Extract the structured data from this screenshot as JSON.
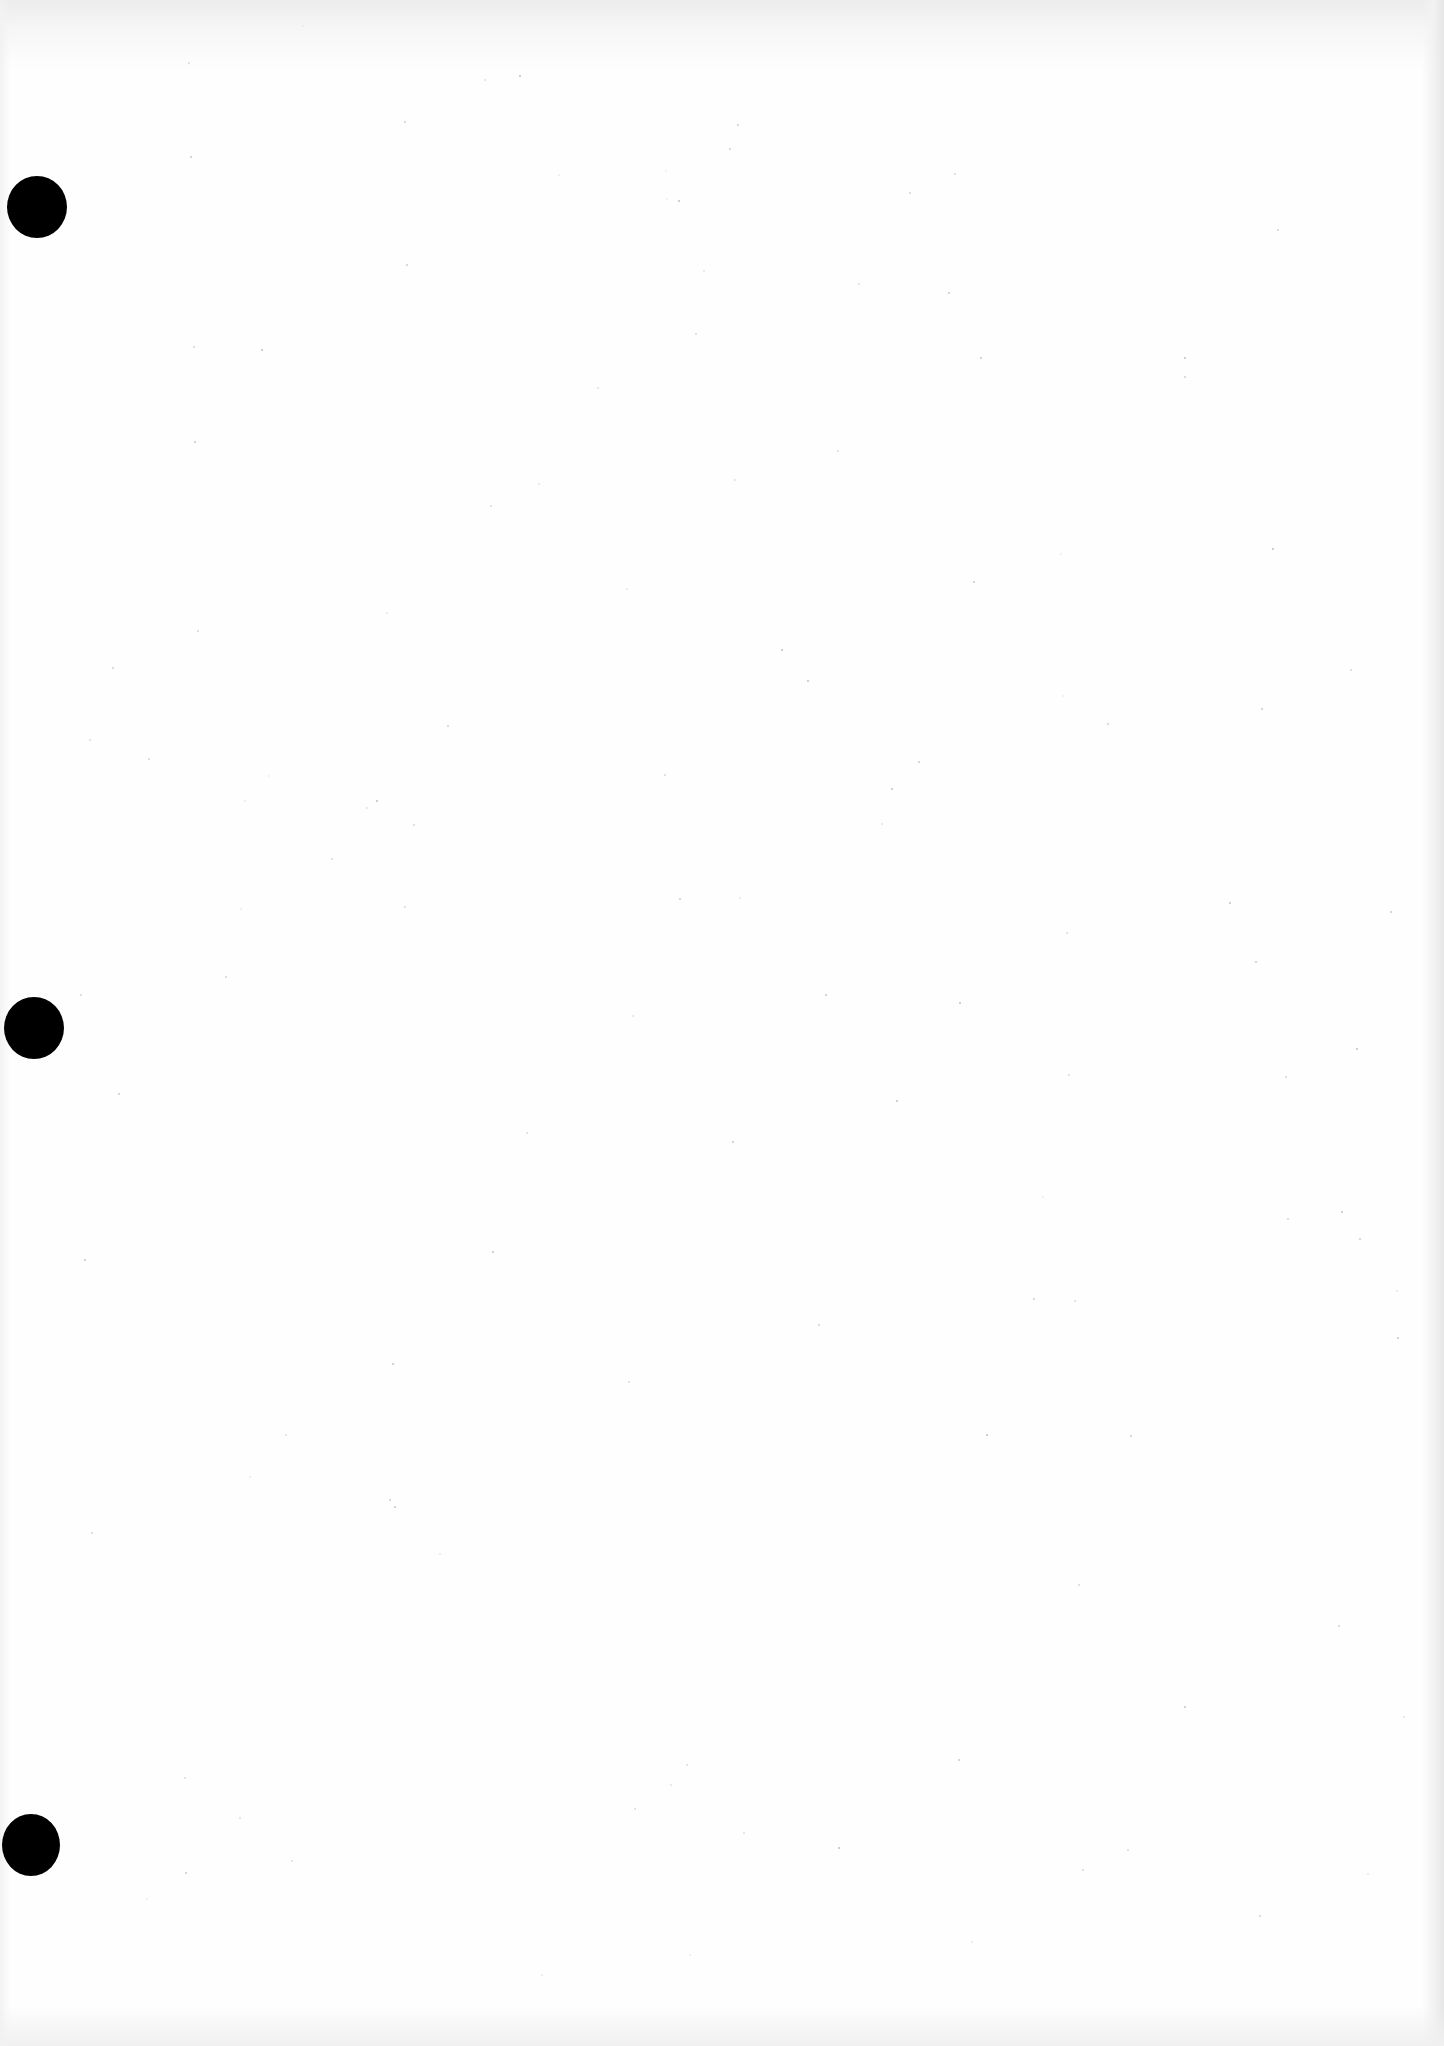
{
  "page": {
    "type": "blank scanned sheet",
    "background_color": "#fefefe",
    "edge_shadow_color": "#e6e6e6",
    "text_content": ""
  },
  "punch_holes": [
    {
      "cx": 37,
      "cy": 207,
      "width": 60,
      "height": 62,
      "color": "#000000"
    },
    {
      "cx": 34,
      "cy": 1028,
      "width": 60,
      "height": 62,
      "color": "#000000"
    },
    {
      "cx": 31,
      "cy": 1845,
      "width": 58,
      "height": 62,
      "color": "#000000"
    }
  ]
}
